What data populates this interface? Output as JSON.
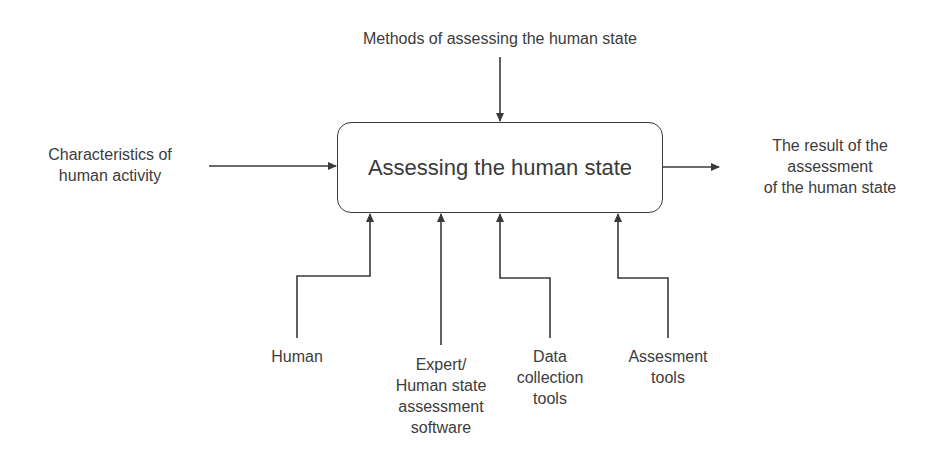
{
  "diagram": {
    "type": "IDEF0 function block",
    "process": {
      "title": "Assessing the human state"
    },
    "control": {
      "label": "Methods of assessing the human state"
    },
    "input": {
      "label": "Characteristics of\nhuman activity"
    },
    "output": {
      "label": "The result of the\nassessment\nof the human state"
    },
    "mechanisms": [
      {
        "label": "Human"
      },
      {
        "label": "Expert/\nHuman state\nassessment\nsoftware"
      },
      {
        "label": "Data\ncollection\ntools"
      },
      {
        "label": "Assesment\ntools"
      }
    ],
    "colors": {
      "line": "#3a3a3a",
      "text": "#3c3c3c",
      "background": "#ffffff"
    }
  }
}
